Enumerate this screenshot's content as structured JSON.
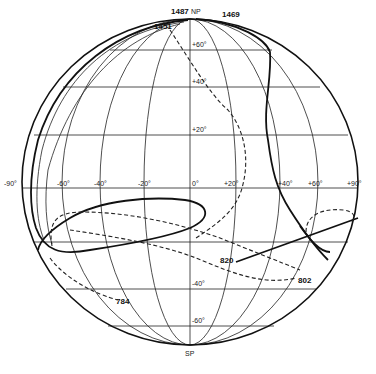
{
  "figure": {
    "type": "orthographic globe projection with pole-path tracks",
    "background": "#ffffff",
    "ink": "#111111"
  },
  "poles": {
    "north": "NP",
    "south": "SP"
  },
  "longitude_labels": [
    "-90°",
    "-60°",
    "-40°",
    "-20°",
    "0°",
    "+20°",
    "+40°",
    "+60°",
    "+90°"
  ],
  "latitude_labels": [
    "+60°",
    "+40°",
    "+20°",
    "-40°",
    "-60°"
  ],
  "track_labels": {
    "t1487": "1487",
    "t1469": "1469",
    "t1451": "1451",
    "t820": "820",
    "t802": "802",
    "t784": "784"
  },
  "tracks": [
    {
      "id": "1487",
      "style": "solid",
      "description": "starts at NP, sweeps down left limb, forms loop in lower-left (around -60° to +5°, -20° to -30°), ends at 820"
    },
    {
      "id": "1469",
      "style": "solid",
      "description": "starts near NP, descends along +40° meridian, curves to lower right near +60°, -30°"
    },
    {
      "id": "1451",
      "style": "dashed",
      "description": "starts near NP, crosses +40° latitude, bulges toward +25°, returns down to right limb loop"
    },
    {
      "id": "802",
      "style": "dashed",
      "description": "ends at label 802 near +50°, -35°"
    },
    {
      "id": "784",
      "style": "dashed",
      "description": "ends at label 784 near -45°, -45°"
    }
  ]
}
